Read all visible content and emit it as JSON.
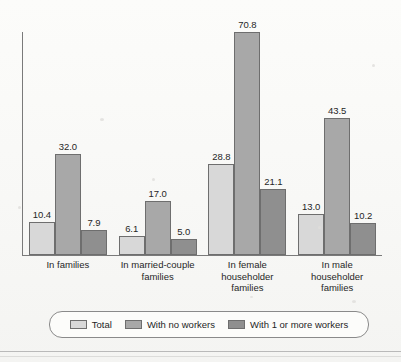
{
  "chart_data": {
    "type": "bar",
    "title": "",
    "subtitle": "",
    "xlabel": "",
    "ylabel": "",
    "grid": false,
    "legend_position": "bottom",
    "ylim": [
      0,
      70.8
    ],
    "axis_tick_labels": [],
    "categories": [
      "In families",
      "In married-couple families",
      "In female householder families",
      "In male householder families"
    ],
    "category_label_lines": [
      [
        "In families"
      ],
      [
        "In married-couple",
        "families"
      ],
      [
        "In female",
        "householder",
        "families"
      ],
      [
        "In male",
        "householder",
        "families"
      ]
    ],
    "series": [
      {
        "name": "Total",
        "color": "#d8d8d8",
        "values": [
          10.4,
          6.1,
          28.8,
          13.0
        ]
      },
      {
        "name": "With no workers",
        "color": "#a8a8a8",
        "values": [
          32.0,
          17.0,
          70.8,
          43.5
        ]
      },
      {
        "name": "With 1 or more workers",
        "color": "#8f8f8f",
        "values": [
          7.9,
          5.0,
          21.1,
          10.2
        ]
      }
    ],
    "value_labels": [
      [
        "10.4",
        "32.0",
        "7.9"
      ],
      [
        "6.1",
        "17.0",
        "5.0"
      ],
      [
        "28.8",
        "70.8",
        "21.1"
      ],
      [
        "13.0",
        "43.5",
        "10.2"
      ]
    ]
  },
  "legend": {
    "entries": [
      {
        "label": "Total"
      },
      {
        "label": "With no workers"
      },
      {
        "label": "With 1 or more workers"
      }
    ]
  }
}
